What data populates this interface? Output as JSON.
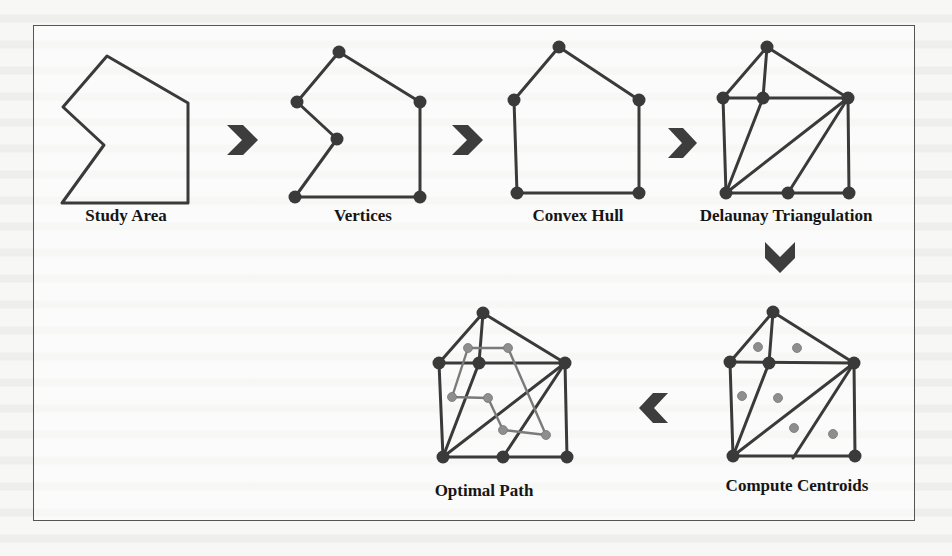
{
  "figure": {
    "steps": [
      {
        "id": "study-area",
        "label": "Study Area"
      },
      {
        "id": "vertices",
        "label": "Vertices"
      },
      {
        "id": "convex-hull",
        "label": "Convex Hull"
      },
      {
        "id": "delaunay",
        "label": "Delaunay Triangulation"
      },
      {
        "id": "centroids",
        "label": "Compute Centroids"
      },
      {
        "id": "optimal-path",
        "label": "Optimal Path"
      }
    ],
    "flow": [
      "Study Area",
      "Vertices",
      "Convex Hull",
      "Delaunay Triangulation",
      "Compute Centroids",
      "Optimal Path"
    ],
    "arrows": [
      {
        "from": "Study Area",
        "to": "Vertices",
        "direction": "right"
      },
      {
        "from": "Vertices",
        "to": "Convex Hull",
        "direction": "right"
      },
      {
        "from": "Convex Hull",
        "to": "Delaunay Triangulation",
        "direction": "right"
      },
      {
        "from": "Delaunay Triangulation",
        "to": "Compute Centroids",
        "direction": "down"
      },
      {
        "from": "Compute Centroids",
        "to": "Optimal Path",
        "direction": "left"
      }
    ],
    "colors": {
      "line": "#3a3a3a",
      "vertex": "#3a3a3a",
      "centroid": "#8a8a8a",
      "arrow": "#3d3d3d",
      "frame": "#555555"
    }
  }
}
